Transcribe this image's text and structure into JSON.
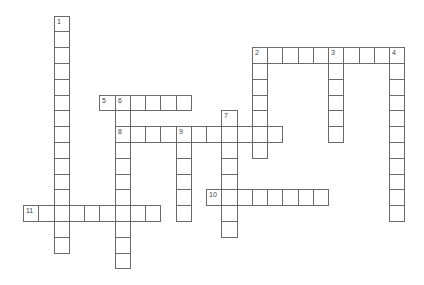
{
  "puzzle": {
    "type": "crossword",
    "entries": [
      {
        "number": "1",
        "direction": "down",
        "row": 0,
        "col": 2,
        "length": 15
      },
      {
        "number": "2",
        "direction": "across",
        "row": 2,
        "col": 15,
        "length": 10
      },
      {
        "number": "2",
        "direction": "down",
        "row": 2,
        "col": 15,
        "length": 7
      },
      {
        "number": "3",
        "direction": "down",
        "row": 2,
        "col": 20,
        "length": 6
      },
      {
        "number": "4",
        "direction": "down",
        "row": 2,
        "col": 24,
        "length": 11
      },
      {
        "number": "5",
        "direction": "across",
        "row": 5,
        "col": 5,
        "length": 6
      },
      {
        "number": "6",
        "direction": "down",
        "row": 5,
        "col": 6,
        "length": 11
      },
      {
        "number": "7",
        "direction": "down",
        "row": 6,
        "col": 13,
        "length": 8
      },
      {
        "number": "8",
        "direction": "across",
        "row": 7,
        "col": 6,
        "length": 11
      },
      {
        "number": "9",
        "direction": "down",
        "row": 7,
        "col": 10,
        "length": 6
      },
      {
        "number": "10",
        "direction": "across",
        "row": 11,
        "col": 12,
        "length": 8
      },
      {
        "number": "11",
        "direction": "across",
        "row": 12,
        "col": 0,
        "length": 9
      }
    ]
  }
}
